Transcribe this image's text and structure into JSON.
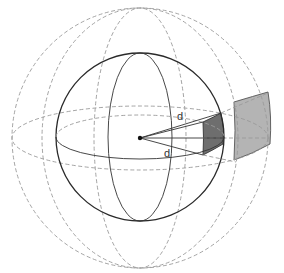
{
  "diagram": {
    "title": "",
    "labels": {
      "d_upper": "d",
      "d_lower": "d"
    },
    "colors": {
      "inner_patch": "#6e6e6e",
      "outer_patch": "#b4b4b4",
      "solid_stroke": "#2a2a2a",
      "dashed_stroke": "#9a9a9a",
      "center_dot": "#111111"
    },
    "elements": [
      "outer-dashed-sphere",
      "outer-dashed-meridians",
      "outer-dashed-equator",
      "inner-solid-sphere",
      "inner-solid-meridian",
      "inner-solid-equator",
      "center-point",
      "radial-lines",
      "inner-shaded-patch",
      "outer-shaded-patch"
    ]
  }
}
